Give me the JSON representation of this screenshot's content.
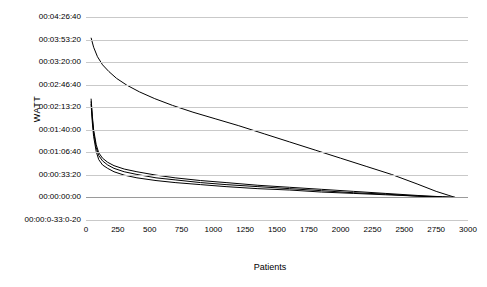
{
  "chart": {
    "type": "line",
    "title": "",
    "xlabel": "Patients",
    "ylabel": "WATT"
  },
  "axes": {
    "y_ticks": [
      "00:04:26:40",
      "00:03:53:20",
      "00:03:20:00",
      "00:02:46:40",
      "00:02:13:20",
      "00:01:40:00",
      "00:01:06:40",
      "00:00:33:20",
      "00:00:00:00",
      "00:00:0-33:0-20"
    ],
    "x_ticks": [
      "0",
      "250",
      "500",
      "750",
      "1000",
      "1250",
      "1500",
      "1750",
      "2000",
      "2250",
      "2500",
      "2750",
      "3000"
    ]
  },
  "chart_data": {
    "type": "line",
    "title": "",
    "xlabel": "Patients",
    "ylabel": "WATT",
    "xlim": [
      0,
      3000
    ],
    "ylim": [
      -33.3,
      266.67
    ],
    "y_tick_values": [
      266.67,
      233.33,
      200,
      166.67,
      133.33,
      100,
      66.67,
      33.33,
      0,
      -33.33
    ],
    "y_tick_labels": [
      "00:04:26:40",
      "00:03:53:20",
      "00:03:20:00",
      "00:02:46:40",
      "00:02:13:20",
      "00:01:40:00",
      "00:01:06:40",
      "00:00:33:20",
      "00:00:00:00",
      "00:00:0-33:0-20"
    ],
    "x_tick_values": [
      0,
      250,
      500,
      750,
      1000,
      1250,
      1500,
      1750,
      2000,
      2250,
      2500,
      2750,
      3000
    ],
    "grid": "horizontal",
    "legend": "none",
    "series": [
      {
        "name": "series-upper",
        "color": "#000000",
        "x": [
          40,
          60,
          90,
          130,
          180,
          240,
          320,
          420,
          540,
          680,
          840,
          1020,
          1200,
          1400,
          1600,
          1800,
          2000,
          2200,
          2400,
          2600,
          2750,
          2850,
          2900
        ],
        "y": [
          236,
          222,
          208,
          196,
          186,
          176,
          166,
          156,
          146,
          136,
          126,
          116,
          106,
          94,
          82,
          70,
          58,
          46,
          34,
          20,
          9,
          3,
          0
        ]
      },
      {
        "name": "series-lower-a",
        "color": "#000000",
        "x": [
          40,
          50,
          60,
          80,
          100,
          130,
          170,
          220,
          300,
          400,
          550,
          700,
          900,
          1100,
          1350,
          1600,
          1850,
          2100,
          2350,
          2600,
          2800,
          2900
        ],
        "y": [
          146,
          120,
          100,
          78,
          66,
          58,
          52,
          47,
          42,
          38,
          33,
          29,
          25,
          22,
          18,
          15,
          12,
          9,
          6,
          3,
          1,
          0
        ]
      },
      {
        "name": "series-lower-b",
        "color": "#000000",
        "x": [
          40,
          50,
          60,
          80,
          100,
          130,
          170,
          220,
          300,
          400,
          550,
          700,
          900,
          1100,
          1350,
          1600,
          1850,
          2100,
          2350,
          2600,
          2800,
          2900
        ],
        "y": [
          142,
          116,
          96,
          74,
          62,
          54,
          48,
          43,
          38,
          34,
          29,
          26,
          22,
          19,
          16,
          13,
          10,
          7,
          5,
          2,
          1,
          0
        ]
      },
      {
        "name": "series-lower-c",
        "color": "#000000",
        "x": [
          40,
          50,
          60,
          80,
          100,
          130,
          170,
          220,
          300,
          400,
          550,
          700,
          900,
          1100,
          1350,
          1600,
          1850,
          2100,
          2350,
          2600,
          2800,
          2900
        ],
        "y": [
          138,
          110,
          90,
          68,
          56,
          48,
          43,
          38,
          33,
          29,
          25,
          22,
          19,
          16,
          13,
          11,
          8,
          6,
          4,
          2,
          0,
          0
        ]
      }
    ]
  }
}
